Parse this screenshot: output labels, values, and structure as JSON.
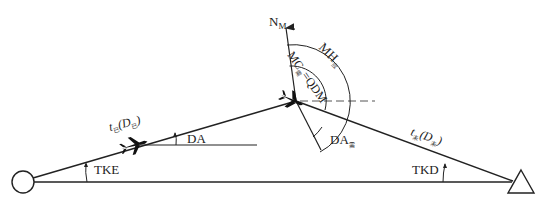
{
  "diagram": {
    "stroke_color": "#222222",
    "dash_color": "#555555",
    "start_point": {
      "shape": "circle",
      "name": "departure-point"
    },
    "end_point": {
      "shape": "triangle",
      "name": "destination-point"
    },
    "labels": {
      "north": {
        "main": "N",
        "sub": "M"
      },
      "mh": {
        "main": "MH",
        "sub": "应"
      },
      "mc_qdm": {
        "main": "MC",
        "sub": "需",
        "rest": "=QDM"
      },
      "flown": {
        "main": "t",
        "sub": "已",
        "paren_open": "(D",
        "sub2": "已",
        "paren_close": ")"
      },
      "remaining": {
        "main": "t",
        "sub": "未",
        "paren_open": "(D",
        "sub2": "未",
        "paren_close": ")"
      },
      "da": "DA",
      "da_req": {
        "main": "DA",
        "sub": "需"
      },
      "tke": "TKE",
      "tkd": "TKD"
    }
  }
}
